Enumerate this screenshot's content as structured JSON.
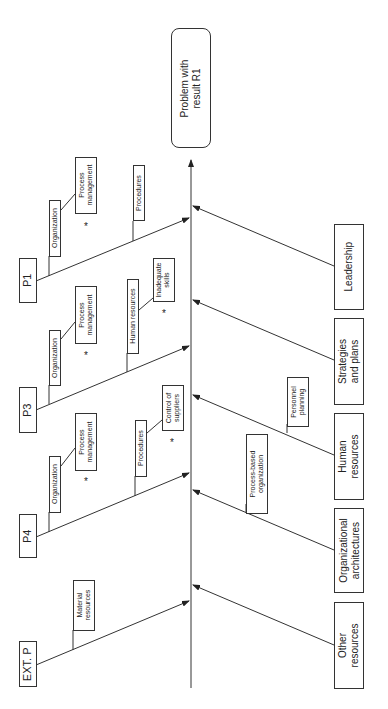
{
  "diagram": {
    "type": "fishbone",
    "effect": "Problem with\nresult R1",
    "sources": [
      {
        "label": "P1",
        "subcauses": [
          "Organization",
          "Process management",
          "Procedures"
        ],
        "flagged": [
          "Process management"
        ]
      },
      {
        "label": "P3",
        "subcauses": [
          "Organization",
          "Process management",
          "Human resources",
          "Inadequate skills"
        ],
        "flagged": [
          "Process management",
          "Inadequate skills"
        ]
      },
      {
        "label": "P4",
        "subcauses": [
          "Organization",
          "Process management",
          "Procedures",
          "Control of suppliers"
        ],
        "flagged": [
          "Process management",
          "Control of suppliers"
        ]
      },
      {
        "label": "EXT. P",
        "subcauses": [
          "Material resources"
        ],
        "flagged": []
      }
    ],
    "causes": [
      {
        "label": "Leadership",
        "subcauses": []
      },
      {
        "label": "Strategies\nand plans",
        "subcauses": []
      },
      {
        "label": "Human\nresources",
        "subcauses": [
          "Personnel planning"
        ]
      },
      {
        "label": "Organizational\narchitectures",
        "subcauses": [
          "Process-based organization"
        ]
      },
      {
        "label": "Other\nresources",
        "subcauses": []
      }
    ],
    "flag_symbol": "*"
  },
  "labels": {
    "problem": "Problem with\nresult R1",
    "p1": "P1",
    "p3": "P3",
    "p4": "P4",
    "extp": "EXT. P",
    "leadership": "Leadership",
    "strategies": "Strategies\nand plans",
    "human": "Human\nresources",
    "orgarch": "Organizational\narchitectures",
    "other": "Other\nresources",
    "organization": "Organization",
    "process_mgmt": "Process\nmanagement",
    "procedures": "Procedures",
    "human_resources": "Human resources",
    "inadequate": "Inadequate\nskills",
    "control": "Control of\nsuppliers",
    "material": "Material\nresources",
    "personnel": "Personnel\nplanning",
    "process_based": "Process-based\norganization",
    "star": "*"
  }
}
